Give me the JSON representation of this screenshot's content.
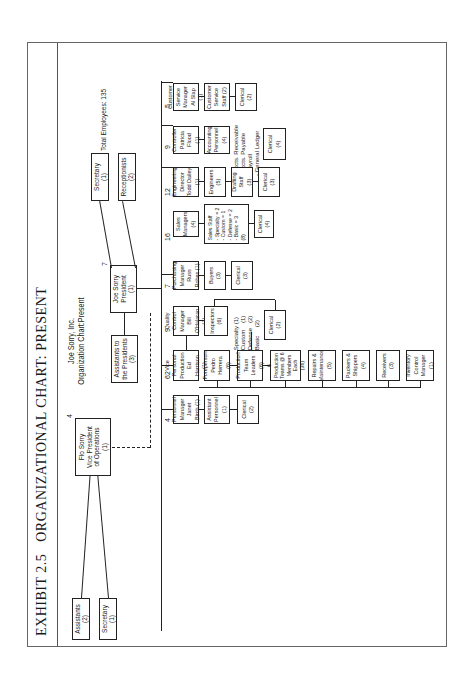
{
  "exhibit": {
    "number": "EXHIBIT 2.5",
    "title": "ORGANIZATIONAL CHART: PRESENT"
  },
  "chart_title": {
    "company": "Joe Sorry, Inc.",
    "subtitle": "Organization Chart:Present"
  },
  "total_employees": "Total Employees: 135",
  "top": {
    "president": "Joe Sorry\nPresident\n(1)",
    "president_count": "7",
    "secretary": "Secretary\n(1)",
    "receptionists": "Receptionists\n(2)",
    "assistants_to_president": "Assistants to\nthe Presidents\n(3)",
    "vp_operations": "Flo Sorry\nVice President\nof Operations\n(1)",
    "vp_operations_count": "4",
    "vp_assistants": "Assistants\n(2)",
    "vp_secretary": "Secretary\n(1)"
  },
  "departments": [
    {
      "head": "Customer\nService Manager\nAl Slap (1)",
      "count": "5",
      "staff": [
        "Customer\nService\nStaff (2)",
        "Clerical\n(2)"
      ]
    },
    {
      "head": "Controller\nPatricia Flood\n(1)",
      "count": "9",
      "staff": [
        "Accounting\nPersonnel\n(4)",
        "Clerical\n(4)"
      ],
      "note": "- Accts. Receivable\n- Accts. Payable\n- Payroll\n- General Ledger"
    },
    {
      "head": "Engineering\nDirector\nTodd Dailey (1)",
      "count": "12",
      "staff": [
        "Engineers\n(5)",
        "Drafting Staff\n(3)",
        "Clerical\n(3)"
      ]
    },
    {
      "head": "Sales\nManagers (4)",
      "count": "16",
      "staff": [
        "Sales Staff\n- Specialty = 2\n- Custom    = 1\n- Defense   = 2\n- Basic     = 3\n(8)",
        "Clerical\n(4)"
      ]
    },
    {
      "head": "Purchasing\nManager\nRuss Rohes (1)",
      "count": "7",
      "staff": [
        "Buyers\n(3)",
        "Clerical\n(3)"
      ]
    },
    {
      "head": "Quality Control\nManager\nBill O'Halaran (1)",
      "count": "9",
      "staff": [
        "Inspectors\n(6)",
        "Clerical\n(2)"
      ],
      "note": "- Specialty (1)\n- Custom    (1)\n- Defense   (2)\n- Basic     (2)"
    },
    {
      "head": "Vice Personal\nProduction\nEd Harrison (1)",
      "count": "62",
      "staff": [
        "Foreperson\nPedro Herrera\n(6)",
        "Production\nTeam Leaders\n(6)",
        "6 Production\nTeams @ 6\nMembers Each\n(36)",
        "Repairs &\nMaintenance\n(5)",
        "Packers &\nShippers\n(4)",
        "Receivers\n(3)",
        "Inventory\nControl\nManager (1)"
      ]
    },
    {
      "head": "Personnel\nManager\nJanet Birch (1)",
      "count": "4",
      "staff": [
        "Assistant\nPersonnel\n(1)",
        "Clerical\n(2)"
      ]
    }
  ]
}
